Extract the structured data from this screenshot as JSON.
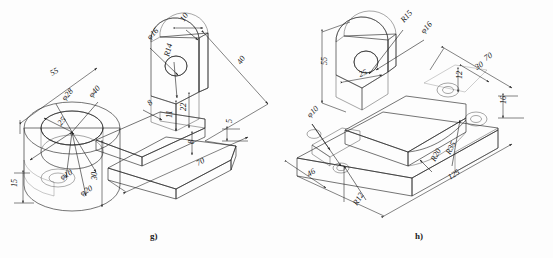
{
  "page": {
    "background_color": "#fdfdfd",
    "ink_color": "#1a1a1a",
    "width": 553,
    "height": 258,
    "content_type": "engineering-isometric-drawings"
  },
  "figures": [
    {
      "id": "g",
      "caption": "g)",
      "description": "Isometric pictorial of a bracket: large vertical cylindrical boss with bore on the left, a horizontal rib / base plate extending right, and an upright triangular rib with a bored boss at the far end.",
      "fill_colors": {
        "top": "#d9d9d9",
        "front": "#b9b9b9",
        "side": "#9f9f9f",
        "dark": "#8a8a8a",
        "light": "#e6e6e6"
      },
      "dimensions": [
        {
          "name": "overall-length-55",
          "label": "55",
          "x": 52,
          "y": 76,
          "rot": -31
        },
        {
          "name": "bore-dia-28",
          "label": "φ28",
          "x": 65,
          "y": 101,
          "rot": -48
        },
        {
          "name": "boss-dia-40",
          "label": "φ40",
          "x": 92,
          "y": 98,
          "rot": -48
        },
        {
          "name": "radius-offset-25",
          "label": "25",
          "x": 61,
          "y": 126,
          "rot": -50
        },
        {
          "name": "small-bore-dia-10",
          "label": "φ10",
          "x": 62,
          "y": 180,
          "rot": -30
        },
        {
          "name": "counter-dia-20",
          "label": "φ20",
          "x": 82,
          "y": 196,
          "rot": -30
        },
        {
          "name": "step-height-15",
          "label": "15",
          "x": 17,
          "y": 187,
          "rot": -90
        },
        {
          "name": "cylinder-height-30",
          "label": "30",
          "x": 97,
          "y": 180,
          "rot": -90
        },
        {
          "name": "rib-bore-dia-16",
          "label": "φ16",
          "x": 150,
          "y": 40,
          "rot": -45
        },
        {
          "name": "rib-radius-14",
          "label": "R14",
          "x": 169,
          "y": 57,
          "rot": -75
        },
        {
          "name": "rib-thickness-10",
          "label": "10",
          "x": 184,
          "y": 22,
          "rot": -58
        },
        {
          "name": "depth-40",
          "label": "40",
          "x": 241,
          "y": 65,
          "rot": -58
        },
        {
          "name": "boss-height-22",
          "label": "22",
          "x": 186,
          "y": 111,
          "rot": -90
        },
        {
          "name": "web-height-11",
          "label": "11",
          "x": 172,
          "y": 118,
          "rot": -90
        },
        {
          "name": "rib-width-8",
          "label": "8",
          "x": 150,
          "y": 106,
          "rot": -42
        },
        {
          "name": "plate-thickness-5",
          "label": "5",
          "x": 232,
          "y": 123,
          "rot": -90
        },
        {
          "name": "base-length-70",
          "label": "70",
          "x": 198,
          "y": 166,
          "rot": -28
        },
        {
          "name": "base-thickness-8",
          "label": "8",
          "x": 194,
          "y": 144,
          "rot": -90
        }
      ]
    },
    {
      "id": "h",
      "caption": "h)",
      "description": "Isometric pictorial of a saddle-type base: semicylindrical bearing boss with bore on the left, long base plate with two counterbored holes on the right and slots in the front face.",
      "fill_colors": {
        "top": "#dcdcdc",
        "front": "#bdbdbd",
        "side": "#a3a3a3",
        "dark": "#8d8d8d",
        "light": "#ececec"
      },
      "dimensions": [
        {
          "name": "boss-radius-15",
          "label": "R15",
          "x": 404,
          "y": 23,
          "rot": -48
        },
        {
          "name": "boss-bore-dia-16",
          "label": "φ16",
          "x": 424,
          "y": 34,
          "rot": -48
        },
        {
          "name": "overall-height-55",
          "label": "55",
          "x": 327,
          "y": 65,
          "rot": -90
        },
        {
          "name": "boss-width-25",
          "label": "25",
          "x": 360,
          "y": 77,
          "rot": -20
        },
        {
          "name": "plate-width-70",
          "label": "70",
          "x": 486,
          "y": 61,
          "rot": -33
        },
        {
          "name": "hole-spacing-30",
          "label": "30",
          "x": 477,
          "y": 70,
          "rot": -33
        },
        {
          "name": "hole-edge-12",
          "label": "12",
          "x": 462,
          "y": 79,
          "rot": -90
        },
        {
          "name": "plate-thickness-16",
          "label": "16",
          "x": 506,
          "y": 104,
          "rot": -90
        },
        {
          "name": "slot-hole-dia-10",
          "label": "φ10",
          "x": 310,
          "y": 118,
          "rot": -45
        },
        {
          "name": "slot-width-46",
          "label": "46",
          "x": 309,
          "y": 177,
          "rot": -33
        },
        {
          "name": "slot-radius-12",
          "label": "R12",
          "x": 357,
          "y": 206,
          "rot": -58
        },
        {
          "name": "fillet-radius-20",
          "label": "R20",
          "x": 435,
          "y": 162,
          "rot": -62
        },
        {
          "name": "outer-radius-35",
          "label": "R35",
          "x": 450,
          "y": 155,
          "rot": -62
        },
        {
          "name": "overall-length-125",
          "label": "125",
          "x": 450,
          "y": 180,
          "rot": -33
        }
      ]
    }
  ]
}
